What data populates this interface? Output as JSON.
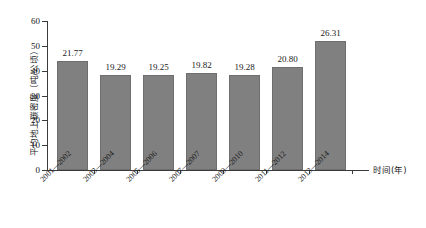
{
  "chart_data": {
    "type": "bar",
    "title": "",
    "xlabel": "时间(年)",
    "ylabel": "平均地上碳密度（吨/公顷）",
    "categories": [
      "2001—2002",
      "2003—2004",
      "2005—2006",
      "2007—2007",
      "2009—2010",
      "2011—2012",
      "2013—2014"
    ],
    "values": [
      21.77,
      19.29,
      19.25,
      19.82,
      19.28,
      20.8,
      26.31
    ],
    "value_labels": [
      "21.77",
      "19.29",
      "19.25",
      "19.82",
      "19.28",
      "20.80",
      "26.31"
    ],
    "bar_heights": [
      43.8,
      38.2,
      38.1,
      39.2,
      38.2,
      41.4,
      52.0
    ],
    "ylim": [
      0,
      60
    ],
    "yticks": [
      0,
      10,
      20,
      30,
      40,
      50,
      60
    ],
    "ytick_labels": [
      "0",
      "10",
      "20",
      "30",
      "40",
      "50",
      "60"
    ],
    "grid": false,
    "legend": "none",
    "bar_color": "#808080",
    "axis_color": "#3a3a3a",
    "series": [
      {
        "name": "平均地上碳密度",
        "values": [
          21.77,
          19.29,
          19.25,
          19.82,
          19.28,
          20.8,
          26.31
        ]
      }
    ]
  }
}
